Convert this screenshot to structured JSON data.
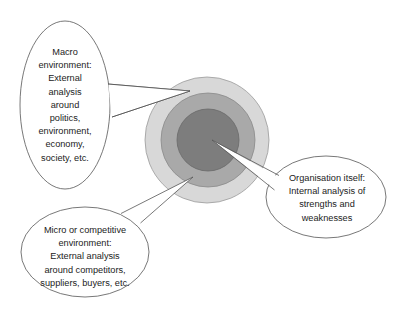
{
  "diagram": {
    "type": "concentric-circles-with-callouts",
    "rings": [
      {
        "name": "outer-ring",
        "color": "#d8d8d8",
        "stroke": "#9a9a9a"
      },
      {
        "name": "middle-ring",
        "color": "#a9a9a9",
        "stroke": "#8a8a8a"
      },
      {
        "name": "inner-circle",
        "color": "#7d7d7d",
        "stroke": "#6a6a6a"
      }
    ],
    "callouts": {
      "macro": {
        "lines": [
          "Macro",
          "environment:",
          "External",
          "analysis",
          "around",
          "politics,",
          "environment,",
          "economy,",
          "society, etc."
        ]
      },
      "micro": {
        "lines": [
          "Micro or competitive",
          "environment:",
          "External analysis",
          "around competitors,",
          "suppliers, buyers, etc."
        ]
      },
      "organisation": {
        "lines": [
          "Organisation itself:",
          "Internal analysis of",
          "strengths and",
          "weaknesses"
        ]
      }
    }
  }
}
